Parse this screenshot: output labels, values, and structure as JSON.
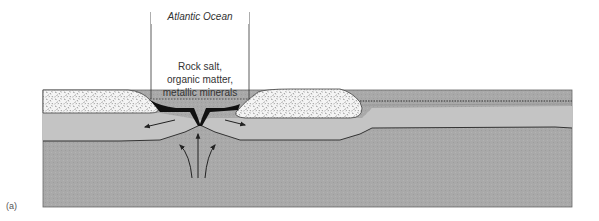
{
  "figure": {
    "panel_label": "(a)",
    "span_label": "Atlantic Ocean",
    "deposit_label_lines": [
      "Rock salt,",
      "organic matter,",
      "metallic minerals"
    ],
    "layers": {
      "continental_crust": "speckled (stippled) continental blocks",
      "lithosphere": "light gray plate layer",
      "asthenosphere": "darker gray mantle",
      "deposits": "black rift-floor sediments"
    },
    "colors": {
      "background": "#ffffff",
      "lithosphere": "#c4c4c4",
      "asthenosphere": "#a9a9a9",
      "continent_fill": "#f4f4f4",
      "speckle": "#6a6a6a",
      "deposit": "#111111",
      "outline": "#444444"
    }
  }
}
